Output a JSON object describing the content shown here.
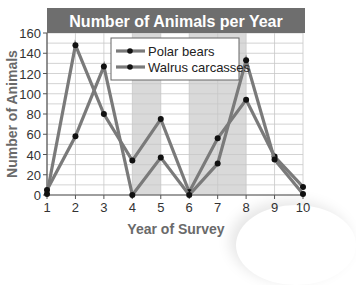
{
  "chart_data": {
    "type": "line",
    "title": "Number of Animals per Year",
    "xlabel": "Year of Survey",
    "ylabel": "Number of Animals",
    "x": [
      1,
      2,
      3,
      4,
      5,
      6,
      7,
      8,
      9,
      10
    ],
    "xticks": [
      "1",
      "2",
      "3",
      "4",
      "5",
      "6",
      "7",
      "8",
      "9",
      "10"
    ],
    "yticks": [
      "0",
      "20",
      "40",
      "60",
      "80",
      "100",
      "120",
      "140",
      "160"
    ],
    "ylim": [
      0,
      160
    ],
    "xlim": [
      1,
      10
    ],
    "grid": true,
    "legend_position": "upper center",
    "series": [
      {
        "name": "Polar bears",
        "values": [
          1,
          148,
          80,
          34,
          75,
          3,
          56,
          94,
          38,
          8
        ]
      },
      {
        "name": "Walrus carcasses",
        "values": [
          5,
          58,
          127,
          0,
          37,
          0,
          31,
          133,
          35,
          1
        ]
      }
    ],
    "shaded_x_ranges": [
      [
        4,
        5
      ],
      [
        6,
        8
      ]
    ]
  },
  "colors": {
    "title_bg": "#6e6e6e",
    "title_text": "#ffffff",
    "line": "#7a7a7a",
    "marker": "#111111",
    "shade": "#d9d9d9",
    "grid": "#c8c8c8",
    "axis_text": "#333333",
    "label_text": "#6a6a6a"
  }
}
